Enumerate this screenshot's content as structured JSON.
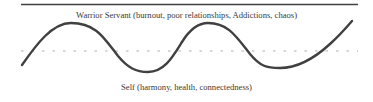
{
  "diagram": {
    "top_label": "Warrior Servant (burnout, poor relationships, Addictions, chaos)",
    "bottom_label": "Self (harmony, health, connectedness)",
    "colors": {
      "line": "#404040",
      "dashed_midline": "#9a9a9a",
      "text": "#3a3a3a"
    }
  }
}
